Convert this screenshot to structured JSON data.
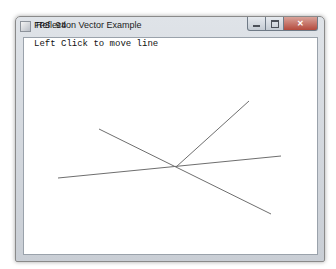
{
  "window": {
    "title": "Reflection Vector Example",
    "controls": {
      "minimize": "minimize",
      "maximize": "maximize",
      "close": "✕"
    }
  },
  "overlay": {
    "fps_label": "FPS 94",
    "instruction": "Left Click to move line"
  },
  "scene": {
    "line_color": "#6e6e6e",
    "surface_line": {
      "x1": 58,
      "y1": 178,
      "x2": 281,
      "y2": 156
    },
    "incident_line": {
      "x1": 99,
      "y1": 129,
      "x2": 271,
      "y2": 214
    },
    "reflected_line": {
      "x1": 176,
      "y1": 167,
      "x2": 249,
      "y2": 101
    }
  }
}
